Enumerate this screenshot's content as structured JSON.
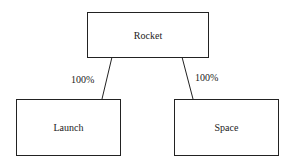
{
  "diagram": {
    "root": {
      "label": "Rocket"
    },
    "children": [
      {
        "label": "Launch",
        "edge_label": "100%"
      },
      {
        "label": "Space",
        "edge_label": "100%"
      }
    ]
  }
}
